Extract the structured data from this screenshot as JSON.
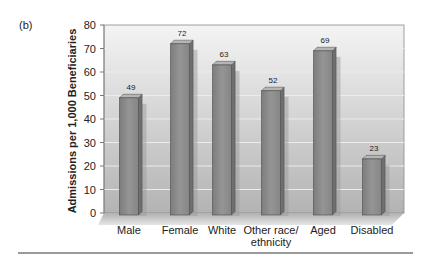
{
  "panel_label": "(b)",
  "chart_data": {
    "type": "bar",
    "title": "",
    "xlabel": "",
    "ylabel": "Admissions per 1,000 Beneficiaries",
    "categories": [
      "Male",
      "Female",
      "White",
      "Other race/ ethnicity",
      "Aged",
      "Disabled"
    ],
    "category_lines": [
      [
        "Male"
      ],
      [
        "Female"
      ],
      [
        "White"
      ],
      [
        "Other race/",
        "ethnicity"
      ],
      [
        "Aged"
      ],
      [
        "Disabled"
      ]
    ],
    "values": [
      49,
      72,
      63,
      52,
      69,
      23
    ],
    "data_labels": [
      "49",
      "72",
      "63",
      "52",
      "69",
      "23"
    ],
    "ylim": [
      0,
      80
    ],
    "yticks": [
      0,
      10,
      20,
      30,
      40,
      50,
      60,
      70,
      80
    ],
    "grid": true,
    "style": "3d-bars",
    "colors": {
      "bar_front": "#8a8a8a",
      "bar_side": "#6e6e6e",
      "bar_top": "#b9b9b9",
      "plot_bg_top": "#f2f2f2",
      "plot_bg_bottom": "#b8b8b8",
      "grid": "#e8e8e8",
      "floor": "#a8a8a8"
    }
  }
}
